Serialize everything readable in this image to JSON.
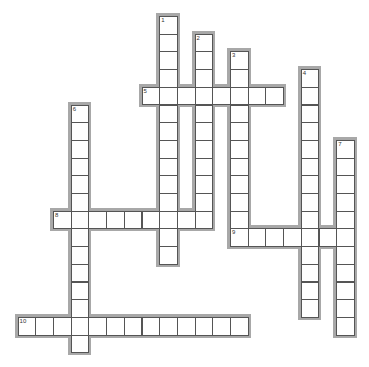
{
  "puzzle": {
    "type": "crossword",
    "cell_size": 17.7,
    "origin": {
      "x": 53,
      "y": 16
    },
    "words": [
      {
        "number": "1",
        "direction": "down",
        "col": 6,
        "row": 0,
        "length": 14
      },
      {
        "number": "2",
        "direction": "down",
        "col": 8,
        "row": 1,
        "length": 11
      },
      {
        "number": "3",
        "direction": "down",
        "col": 10,
        "row": 2,
        "length": 11
      },
      {
        "number": "4",
        "direction": "down",
        "col": 14,
        "row": 3,
        "length": 14
      },
      {
        "number": "5",
        "direction": "across",
        "col": 5,
        "row": 4,
        "length": 8
      },
      {
        "number": "6",
        "direction": "down",
        "col": 1,
        "row": 5,
        "length": 14
      },
      {
        "number": "7",
        "direction": "down",
        "col": 16,
        "row": 7,
        "length": 11
      },
      {
        "number": "8",
        "direction": "across",
        "col": 0,
        "row": 11,
        "length": 9
      },
      {
        "number": "9",
        "direction": "across",
        "col": 10,
        "row": 12,
        "length": 7
      },
      {
        "number": "10",
        "direction": "across",
        "col": -2,
        "row": 17,
        "length": 13
      }
    ]
  }
}
